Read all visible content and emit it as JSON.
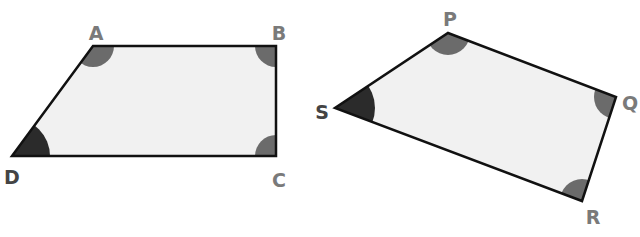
{
  "colors": {
    "fill": "#f1f1f1",
    "stroke": "#111111",
    "angle_mark": "#6b6b6b",
    "angle_mark_dark": "#2b2b2b",
    "label": "#7a7a7a",
    "label_dark": "#444444"
  },
  "shapes": [
    {
      "name": "ABCD",
      "vertices": [
        {
          "label": "A",
          "x": 93,
          "y": 46,
          "angle_shade": "medium",
          "label_x": 96,
          "label_y": 40
        },
        {
          "label": "B",
          "x": 276,
          "y": 46,
          "angle_shade": "medium",
          "label_x": 279,
          "label_y": 40
        },
        {
          "label": "C",
          "x": 276,
          "y": 156,
          "angle_shade": "medium",
          "label_x": 279,
          "label_y": 187
        },
        {
          "label": "D",
          "x": 12,
          "y": 156,
          "angle_shade": "dark",
          "label_x": 12,
          "label_y": 184
        }
      ]
    },
    {
      "name": "PQRS",
      "vertices": [
        {
          "label": "P",
          "x": 448,
          "y": 33,
          "angle_shade": "medium",
          "label_x": 450,
          "label_y": 26
        },
        {
          "label": "Q",
          "x": 616,
          "y": 97,
          "angle_shade": "medium",
          "label_x": 630,
          "label_y": 110
        },
        {
          "label": "R",
          "x": 582,
          "y": 201,
          "angle_shade": "medium",
          "label_x": 593,
          "label_y": 224
        },
        {
          "label": "S",
          "x": 335,
          "y": 108,
          "angle_shade": "dark",
          "label_x": 322,
          "label_y": 119
        }
      ]
    }
  ]
}
